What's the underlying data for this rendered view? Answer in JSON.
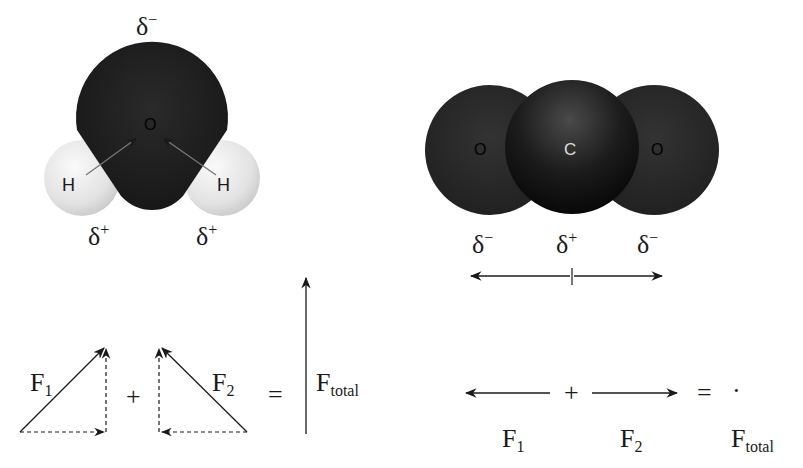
{
  "water_molecule": {
    "top_charge": {
      "symbol": "δ",
      "sign": "−"
    },
    "oxygen_label": "O",
    "hydrogen_labels": [
      "H",
      "H"
    ],
    "bottom_charges": [
      {
        "symbol": "δ",
        "sign": "+"
      },
      {
        "symbol": "δ",
        "sign": "+"
      }
    ],
    "colors": {
      "oxygen": "#1e1e1e",
      "hydrogen": "#e6e6e6"
    }
  },
  "co2_molecule": {
    "atom_labels": [
      "O",
      "C",
      "O"
    ],
    "charges": [
      {
        "symbol": "δ",
        "sign": "−"
      },
      {
        "symbol": "δ",
        "sign": "+"
      },
      {
        "symbol": "δ",
        "sign": "−"
      }
    ],
    "colors": {
      "oxygen": "#2a2a2a",
      "carbon": "#141414",
      "carbon_label": "#dddddd"
    }
  },
  "water_vectors": {
    "f1": {
      "base": "F",
      "sub": "1"
    },
    "f2": {
      "base": "F",
      "sub": "2"
    },
    "plus": "+",
    "equals": "=",
    "ftotal": {
      "base": "F",
      "sub": "total"
    }
  },
  "co2_vectors": {
    "f1": {
      "base": "F",
      "sub": "1"
    },
    "f2": {
      "base": "F",
      "sub": "2"
    },
    "plus": "+",
    "equals": "=",
    "dot": "·",
    "ftotal": {
      "base": "F",
      "sub": "total"
    }
  }
}
